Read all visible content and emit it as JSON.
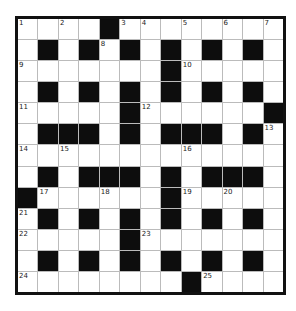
{
  "puzzle": {
    "rows": 13,
    "cols": 13,
    "colors": {
      "black": "#0d0d0d",
      "white": "#ffffff",
      "border": "#111111",
      "gridline": "#bbbbbb"
    },
    "layout": [
      "....#........",
      ".#.#.#.#.#.#.",
      ".......#.....",
      ".#.#.#.#.#.#.",
      ".....#......#",
      ".###.#.###.#.",
      ".............",
      ".#.###.#.###.",
      "#......#.....",
      ".#.#.#.#.#.#.",
      ".....#.......",
      ".#.#.#.#.#.#.",
      "........#...."
    ],
    "numbers": [
      {
        "r": 0,
        "c": 0,
        "n": "1"
      },
      {
        "r": 0,
        "c": 2,
        "n": "2"
      },
      {
        "r": 0,
        "c": 5,
        "n": "3"
      },
      {
        "r": 0,
        "c": 6,
        "n": "4"
      },
      {
        "r": 0,
        "c": 8,
        "n": "5"
      },
      {
        "r": 0,
        "c": 10,
        "n": "6"
      },
      {
        "r": 0,
        "c": 12,
        "n": "7"
      },
      {
        "r": 1,
        "c": 4,
        "n": "8"
      },
      {
        "r": 2,
        "c": 0,
        "n": "9"
      },
      {
        "r": 2,
        "c": 8,
        "n": "10"
      },
      {
        "r": 4,
        "c": 0,
        "n": "11"
      },
      {
        "r": 4,
        "c": 6,
        "n": "12"
      },
      {
        "r": 5,
        "c": 12,
        "n": "13"
      },
      {
        "r": 6,
        "c": 0,
        "n": "14"
      },
      {
        "r": 6,
        "c": 2,
        "n": "15"
      },
      {
        "r": 6,
        "c": 8,
        "n": "16"
      },
      {
        "r": 8,
        "c": 1,
        "n": "17"
      },
      {
        "r": 8,
        "c": 4,
        "n": "18"
      },
      {
        "r": 8,
        "c": 8,
        "n": "19"
      },
      {
        "r": 8,
        "c": 10,
        "n": "20"
      },
      {
        "r": 9,
        "c": 0,
        "n": "21"
      },
      {
        "r": 10,
        "c": 0,
        "n": "22"
      },
      {
        "r": 10,
        "c": 6,
        "n": "23"
      },
      {
        "r": 12,
        "c": 0,
        "n": "24"
      },
      {
        "r": 12,
        "c": 9,
        "n": "25"
      }
    ]
  }
}
